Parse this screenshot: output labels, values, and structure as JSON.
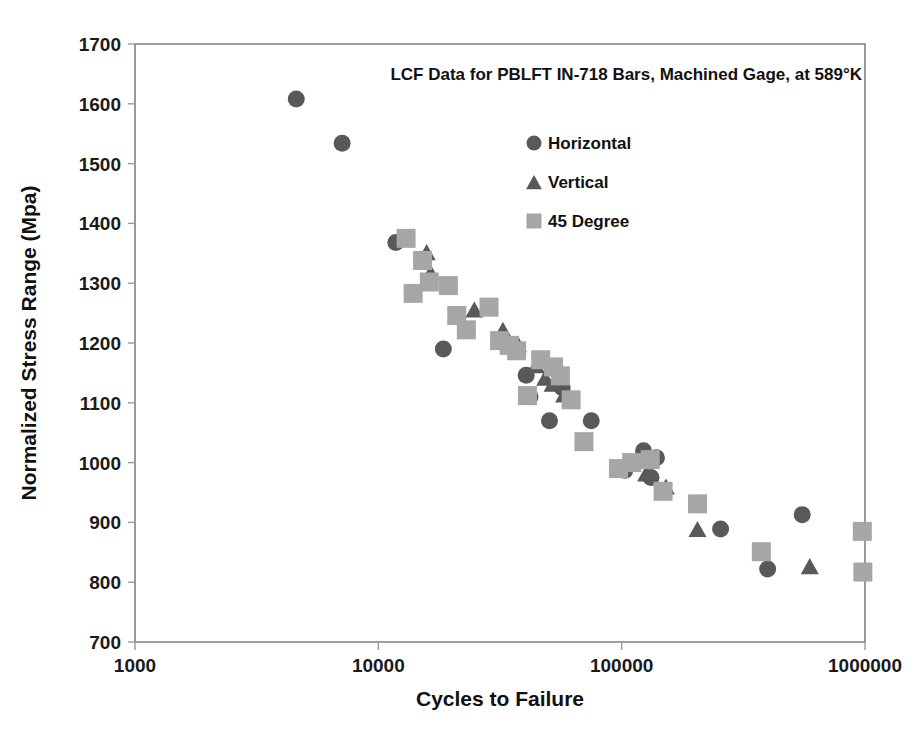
{
  "chart_data": {
    "type": "scatter",
    "title": "LCF Data for PBLFT IN-718 Bars, Machined Gage, at 589°K",
    "xlabel": "Cycles to Failure",
    "ylabel": "Normalized Stress Range  (Mpa)",
    "xscale": "log",
    "yscale": "linear",
    "xlim": [
      1000,
      1000000
    ],
    "ylim": [
      700,
      1700
    ],
    "xticks": [
      1000,
      10000,
      100000,
      1000000
    ],
    "xtick_labels": [
      "1000",
      "10000",
      "100000",
      "1000000"
    ],
    "yticks": [
      700,
      800,
      900,
      1000,
      1100,
      1200,
      1300,
      1400,
      1500,
      1600,
      1700
    ],
    "ytick_labels": [
      "700",
      "800",
      "900",
      "1000",
      "1100",
      "1200",
      "1300",
      "1400",
      "1500",
      "1600",
      "1700"
    ],
    "grid": false,
    "legend_position": "upper-center-right",
    "series": [
      {
        "name": "Horizontal",
        "marker": "circle",
        "color": "#595959",
        "size": 17,
        "points": [
          [
            4600,
            1608
          ],
          [
            7100,
            1534
          ],
          [
            11800,
            1368
          ],
          [
            18500,
            1190
          ],
          [
            40500,
            1146
          ],
          [
            42000,
            1110
          ],
          [
            50500,
            1070
          ],
          [
            57000,
            1125
          ],
          [
            75000,
            1070
          ],
          [
            103000,
            987
          ],
          [
            123000,
            1020
          ],
          [
            132000,
            975
          ],
          [
            139000,
            1008
          ],
          [
            255000,
            889
          ],
          [
            398000,
            822
          ],
          [
            552000,
            913
          ]
        ]
      },
      {
        "name": "Vertical",
        "marker": "triangle",
        "color": "#595959",
        "size": 17,
        "points": [
          [
            15800,
            1352
          ],
          [
            16400,
            1318
          ],
          [
            24800,
            1256
          ],
          [
            32500,
            1222
          ],
          [
            37500,
            1198
          ],
          [
            44500,
            1163
          ],
          [
            48500,
            1142
          ],
          [
            52000,
            1132
          ],
          [
            58000,
            1114
          ],
          [
            120000,
            1005
          ],
          [
            126000,
            982
          ],
          [
            152000,
            960
          ],
          [
            205000,
            889
          ],
          [
            593000,
            827
          ]
        ]
      },
      {
        "name": "45 Degree",
        "marker": "square",
        "color": "#a6a6a6",
        "size": 19,
        "points": [
          [
            13000,
            1375
          ],
          [
            13900,
            1283
          ],
          [
            15200,
            1338
          ],
          [
            16200,
            1302
          ],
          [
            19400,
            1296
          ],
          [
            21000,
            1246
          ],
          [
            23000,
            1222
          ],
          [
            28500,
            1260
          ],
          [
            31500,
            1204
          ],
          [
            34500,
            1196
          ],
          [
            37000,
            1187
          ],
          [
            41000,
            1112
          ],
          [
            46500,
            1172
          ],
          [
            52500,
            1160
          ],
          [
            56000,
            1145
          ],
          [
            62000,
            1105
          ],
          [
            70000,
            1035
          ],
          [
            97000,
            990
          ],
          [
            110000,
            1000
          ],
          [
            131000,
            1005
          ],
          [
            148000,
            952
          ],
          [
            205000,
            931
          ],
          [
            375000,
            851
          ],
          [
            975000,
            885
          ],
          [
            980000,
            817
          ]
        ]
      }
    ]
  },
  "legend": {
    "entries": [
      {
        "label": "Horizontal",
        "marker": "circle",
        "color": "#595959"
      },
      {
        "label": "Vertical",
        "marker": "triangle",
        "color": "#595959"
      },
      {
        "label": "45 Degree",
        "marker": "square",
        "color": "#a6a6a6"
      }
    ]
  },
  "colors": {
    "horizontal": "#595959",
    "vertical": "#595959",
    "degree45": "#a6a6a6",
    "axis": "#808080",
    "text": "#111111",
    "background": "#ffffff"
  }
}
